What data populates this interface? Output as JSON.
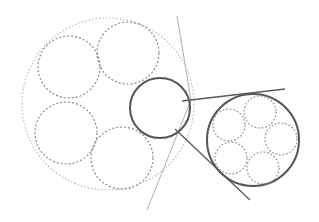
{
  "diagram": {
    "width": 319,
    "height": 222,
    "colors": {
      "background": "#ffffff",
      "outer_dotted": "#bdbdbd",
      "inner_dashed": "#8a8a8a",
      "solid_circle": "#555555",
      "tangent_line": "#5a5a5a",
      "thin_line": "#b0b0b0"
    },
    "outer_circle": {
      "cx": 108,
      "cy": 104,
      "r": 86
    },
    "left_inner_circles": [
      {
        "cx": 69,
        "cy": 67,
        "r": 31
      },
      {
        "cx": 128,
        "cy": 53,
        "r": 31
      },
      {
        "cx": 66,
        "cy": 133,
        "r": 31
      },
      {
        "cx": 122,
        "cy": 158,
        "r": 31
      }
    ],
    "middle_solid_circle": {
      "cx": 160,
      "cy": 108,
      "r": 30
    },
    "right_solid_circle": {
      "cx": 253,
      "cy": 140,
      "r": 46
    },
    "right_inner_circles": [
      {
        "cx": 229,
        "cy": 125,
        "r": 16
      },
      {
        "cx": 260,
        "cy": 112,
        "r": 16
      },
      {
        "cx": 281,
        "cy": 139,
        "r": 16
      },
      {
        "cx": 231,
        "cy": 158,
        "r": 16
      },
      {
        "cx": 263,
        "cy": 168,
        "r": 16
      }
    ],
    "thin_bent_line": [
      [
        177,
        16
      ],
      [
        191,
        100
      ],
      [
        147,
        210
      ]
    ],
    "tangent_lines": [
      {
        "x1": 182,
        "y1": 101,
        "x2": 285,
        "y2": 89
      },
      {
        "x1": 175,
        "y1": 129,
        "x2": 250,
        "y2": 200
      }
    ]
  }
}
